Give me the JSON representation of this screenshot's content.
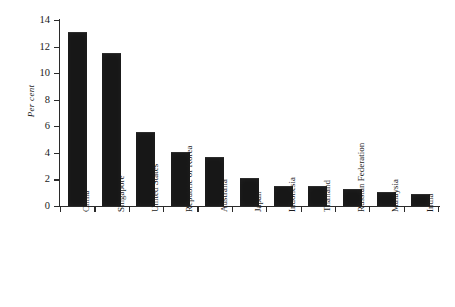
{
  "chart_data": {
    "type": "bar",
    "title": "",
    "xlabel": "",
    "ylabel": "Per cent",
    "ylim": [
      0,
      14
    ],
    "yticks": [
      0,
      2,
      4,
      6,
      8,
      10,
      12,
      14
    ],
    "grid": false,
    "legend": null,
    "bar_color": "#171717",
    "axis_color": "#2b2b2b",
    "background": "#ffffff",
    "categories": [
      "China",
      "Singapore",
      "United States",
      "Republic of Korea",
      "Australia",
      "Japan",
      "Indonesia",
      "Thailand",
      "Russian Federation",
      "Malaysia",
      "India"
    ],
    "values": [
      13.0,
      11.45,
      5.5,
      4.0,
      3.6,
      2.0,
      1.45,
      1.45,
      1.2,
      1.0,
      0.85
    ]
  }
}
